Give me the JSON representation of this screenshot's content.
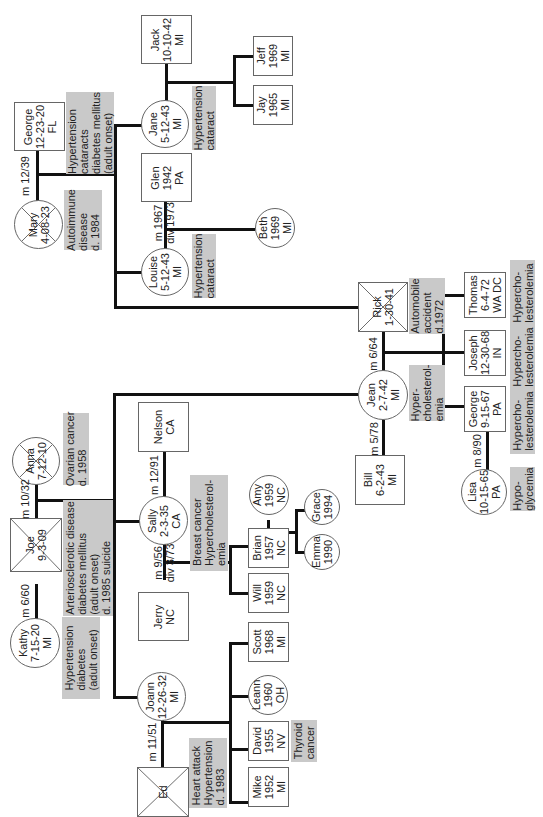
{
  "diagram": {
    "type": "pedigree-genogram",
    "orientation": "rotated-90-ccw",
    "people": {
      "jack": {
        "name": "Jack",
        "text": "Jack\n10-10-42\nMI",
        "sex": "male"
      },
      "jeff": {
        "name": "Jeff",
        "text": "Jeff\n1969\nMI",
        "sex": "male"
      },
      "jay": {
        "name": "Jay",
        "text": "Jay\n1965\nMI",
        "sex": "male"
      },
      "george_sr": {
        "name": "George",
        "text": "George\n12-23-20\nFL",
        "sex": "male"
      },
      "mary": {
        "name": "Mary",
        "text": "Mary\n4-08-23",
        "sex": "female",
        "deceased": true
      },
      "jane": {
        "name": "Jane",
        "text": "Jane\n5-12-43\nMI",
        "sex": "female"
      },
      "glen": {
        "name": "Glen",
        "text": "Glen\n1942\nPA",
        "sex": "male"
      },
      "louise": {
        "name": "Louise",
        "text": "Louise\n5-12-43\nMI",
        "sex": "female"
      },
      "beth": {
        "name": "Beth",
        "text": "Beth\n1969\nMI",
        "sex": "female"
      },
      "rick": {
        "name": "Rick",
        "text": "Rick\n1-30-41",
        "sex": "male",
        "deceased": true
      },
      "thomas": {
        "name": "Thomas",
        "text": "Thomas\n6-4-72\nWA DC",
        "sex": "male"
      },
      "joseph": {
        "name": "Joseph",
        "text": "Joseph\n12-30-68\nIN",
        "sex": "male"
      },
      "george_jr": {
        "name": "George",
        "text": "George\n9-15-67\nPA",
        "sex": "male"
      },
      "jean": {
        "name": "Jean",
        "text": "Jean\n2-7-42\nMI",
        "sex": "female"
      },
      "bill": {
        "name": "Bill",
        "text": "Bill\n6-2-43\nMI",
        "sex": "male"
      },
      "lisa": {
        "name": "Lisa",
        "text": "Lisa\n10-15-65\nPA",
        "sex": "female"
      },
      "anna": {
        "name": "Anna",
        "text": "Anna\n7-12-10",
        "sex": "female",
        "deceased": true
      },
      "joe": {
        "name": "Joe",
        "text": "Joe\n9-3-09",
        "sex": "male",
        "deceased": true
      },
      "kathy": {
        "name": "Kathy",
        "text": "Kathy\n7-15-20\nMI",
        "sex": "female"
      },
      "nelson": {
        "name": "Nelson",
        "text": "Nelson\nCA",
        "sex": "male"
      },
      "sally": {
        "name": "Sally",
        "text": "Sally\n2-3-35\nCA",
        "sex": "female"
      },
      "amy": {
        "name": "Amy",
        "text": "Amy\n1959\nNC",
        "sex": "female"
      },
      "grace": {
        "name": "Grace",
        "text": "Grace\n1994",
        "sex": "female"
      },
      "emma": {
        "name": "Emma",
        "text": "Emma\n1990",
        "sex": "female"
      },
      "brian": {
        "name": "Brian",
        "text": "Brian\n1957\nNC",
        "sex": "male"
      },
      "will": {
        "name": "Will",
        "text": "Will\n1959\nNC",
        "sex": "male"
      },
      "jerry": {
        "name": "Jerry",
        "text": "Jerry\nNC",
        "sex": "male"
      },
      "joann": {
        "name": "Joann",
        "text": "Joann\n12-26-32\nMI",
        "sex": "female"
      },
      "scott": {
        "name": "Scott",
        "text": "Scott\n1968\nMI",
        "sex": "male"
      },
      "leann": {
        "name": "Leann",
        "text": "Leann\n1960\nOH",
        "sex": "female"
      },
      "david": {
        "name": "David",
        "text": "David\n1955\nNV",
        "sex": "male"
      },
      "mike": {
        "name": "Mike",
        "text": "Mike\n1952\nMI",
        "sex": "male"
      },
      "ed": {
        "name": "Ed",
        "text": "Ed",
        "sex": "male",
        "deceased": true
      }
    },
    "notes": {
      "george_sr": "Hypertension\ncataracts\ndiabetes mellitus\n(adult onset)",
      "mary": "Autoimmune\ndisease\nd. 1984",
      "jane": "Hypertension\ncataract",
      "louise": "Hypertension\ncataract",
      "rick": "Automobile\naccident\nd.1972",
      "thomas": "Hypercho-\nlesterolemia",
      "joseph": "Hypercho-\nlesterolemia",
      "george_jr": "Hypercho-\nlesterolemia",
      "jean": "Hyper-\ncholesterol-\nemia",
      "lisa": "Hypo-\nglycemia",
      "anna": "Ovarian cancer\nd. 1958",
      "joe": "Arteriosclerotic disease\ndiabetes mellitus\n(adult onset)\nd. 1985 suicide",
      "kathy": "Hypertension\ndiabetes\n(adult onset)",
      "sally": "Breast cancer\nHypercholesterol-\nemia",
      "david": "Thyroid\ncancer",
      "ed": "Heart attack\nHypertension\nd. 1983"
    },
    "unions": {
      "mary_george": "m 12/39",
      "louise_glen": "m 1967\ndiv 1973",
      "jean_rick": "m 6/64",
      "jean_bill": "m 5/78",
      "george_lisa": "m 8/90",
      "joe_anna": "m 10/32",
      "joe_kathy": "m 6/60",
      "sally_nelson": "m 12/91",
      "sally_jerry": "m 9/56\ndiv 3/73",
      "joann_ed": "m 11/51"
    }
  }
}
